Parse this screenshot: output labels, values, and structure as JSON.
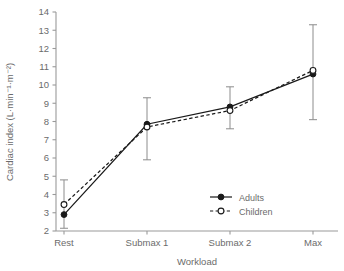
{
  "chart_data": {
    "type": "line",
    "title": "",
    "xlabel": "Workload",
    "ylabel": "Cardiac index (L·min⁻¹·m⁻²)",
    "categories": [
      "Rest",
      "Submax 1",
      "Submax 2",
      "Max"
    ],
    "ylim": [
      2,
      14
    ],
    "yticks": [
      2,
      3,
      4,
      5,
      6,
      7,
      8,
      9,
      10,
      11,
      12,
      13,
      14
    ],
    "ytick_labels": [
      "2",
      "3",
      "4",
      "5",
      "6",
      "7",
      "8",
      "9",
      "10",
      "11",
      "12",
      "13",
      "14"
    ],
    "grid": false,
    "legend_position": "inside-lower-right",
    "series": [
      {
        "name": "Adults",
        "line_style": "solid",
        "marker": "filled-circle",
        "color": "#1a1a1a",
        "values": [
          2.9,
          7.85,
          8.8,
          10.6
        ],
        "error_low": [
          2.15,
          5.9,
          7.6,
          8.1
        ],
        "error_high": [
          3.05,
          9.3,
          9.9,
          13.3
        ]
      },
      {
        "name": "Children",
        "line_style": "dashed",
        "marker": "open-circle",
        "color": "#1a1a1a",
        "values": [
          3.45,
          7.7,
          8.6,
          10.8
        ],
        "error_low": [
          2.15,
          5.9,
          7.6,
          8.1
        ],
        "error_high": [
          4.8,
          9.3,
          9.9,
          13.3
        ]
      }
    ]
  },
  "legend": {
    "items": [
      {
        "label": "Adults"
      },
      {
        "label": "Children"
      }
    ]
  },
  "axes": {
    "x_title": "Workload",
    "y_title": "Cardiac index (L·min⁻¹·m⁻²)"
  },
  "colors": {
    "axis": "#9a9a9a",
    "series": "#1a1a1a",
    "error_bar": "#8c8c8c",
    "text": "#6b6b6b",
    "background": "#ffffff"
  }
}
